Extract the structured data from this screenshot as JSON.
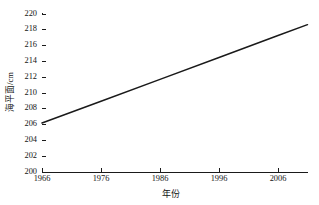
{
  "chart_data": {
    "type": "line",
    "title": "",
    "xlabel": "年份",
    "ylabel": "海平面/cm",
    "xlim": [
      1966,
      2011
    ],
    "ylim": [
      200,
      220
    ],
    "xticks": [
      1966,
      1976,
      1986,
      1996,
      2006
    ],
    "yticks": [
      200,
      202,
      204,
      206,
      208,
      210,
      212,
      214,
      216,
      218,
      220
    ],
    "grid": false,
    "legend": null,
    "series": [
      {
        "name": "海平面",
        "color": "#1a1a1a",
        "x": [
          1966,
          1976,
          1986,
          1996,
          2006,
          2011
        ],
        "values": [
          206.2,
          208.96,
          211.73,
          214.5,
          217.27,
          218.65
        ]
      }
    ]
  },
  "axes": {
    "y_title": "海平面/cm",
    "x_title": "年份",
    "y_tick_labels": [
      "220",
      "218",
      "216",
      "214",
      "212",
      "210",
      "208",
      "206",
      "204",
      "202",
      "200"
    ],
    "x_tick_labels": [
      "1966",
      "1976",
      "1986",
      "1996",
      "2006"
    ]
  },
  "colors": {
    "line": "#1a1a1a",
    "axis": "#1a1a1a",
    "text": "#141414",
    "background": "#ffffff"
  }
}
